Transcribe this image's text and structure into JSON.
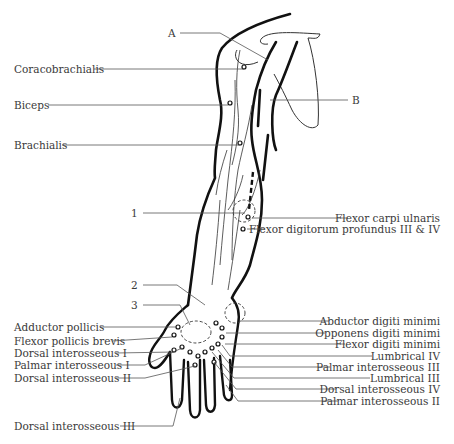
{
  "diagram": {
    "letter_labels": [
      {
        "id": "A",
        "text": "A"
      },
      {
        "id": "B",
        "text": "B"
      }
    ],
    "number_labels": [
      {
        "id": "1",
        "text": "1"
      },
      {
        "id": "2",
        "text": "2"
      },
      {
        "id": "3",
        "text": "3"
      }
    ],
    "left_labels": [
      {
        "text": "Coracobrachialis"
      },
      {
        "text": "Biceps"
      },
      {
        "text": "Brachialis"
      },
      {
        "text": "Adductor pollicis"
      },
      {
        "text": "Flexor pollicis brevis"
      },
      {
        "text": "Dorsal interosseous I"
      },
      {
        "text": "Palmar interosseous I"
      },
      {
        "text": "Dorsal interosseous II"
      },
      {
        "text": "Dorsal interosseous III"
      }
    ],
    "right_labels": [
      {
        "text": "Flexor carpi ulnaris"
      },
      {
        "text": "Flexor digitorum profundus III & IV"
      },
      {
        "text": "Abductor digiti minimi"
      },
      {
        "text": "Opponens digiti minimi"
      },
      {
        "text": "Flexor digiti minimi"
      },
      {
        "text": "Lumbrical IV"
      },
      {
        "text": "Palmar interosseous III"
      },
      {
        "text": "Lumbrical III"
      },
      {
        "text": "Dorsal interosseous IV"
      },
      {
        "text": "Palmar interosseous II"
      }
    ],
    "colors": {
      "outline": "#1a1a1a",
      "leader": "#555555",
      "text": "#3a3a3a",
      "background": "#ffffff"
    }
  }
}
